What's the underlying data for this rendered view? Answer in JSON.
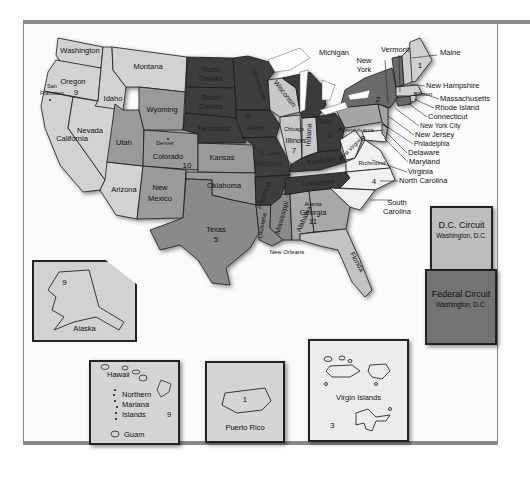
{
  "colors": {
    "light": "#d2d2d2",
    "mid": "#9a9a9a",
    "midDark": "#7e7e7e",
    "dark": "#3a3a3a",
    "white": "#f6f6f6",
    "lakes": "#ffffff",
    "border": "#1a1a1a"
  },
  "states": {
    "washington": "Washington",
    "oregon": "Oregon",
    "california": "California",
    "nevada": "Nevada",
    "idaho": "Idaho",
    "montana": "Montana",
    "arizona": "Arizona",
    "utah": "Utah",
    "wyoming": "Wyoming",
    "colorado": "Colorado",
    "new_mexico": "New\nMexico",
    "kansas": "Kansas",
    "oklahoma": "Oklahoma",
    "texas": "Texas",
    "north_dakota": "North\nDakota",
    "south_dakota": "South\nDakota",
    "nebraska": "Nebraska",
    "minnesota": "Minnesota",
    "iowa": "Iowa",
    "missouri": "Missouri",
    "arkansas": "Arkansas",
    "wisconsin": "Wisconsin",
    "illinois": "Illinois",
    "indiana": "Indiana",
    "michigan": "Michigan",
    "ohio": "Ohio",
    "kentucky": "Kentucky",
    "tennessee": "Tennessee",
    "louisiana": "Louisiana",
    "mississippi": "Mississippi",
    "alabama": "Alabama",
    "georgia": "Georgia",
    "florida": "Florida",
    "south_carolina": "South\nCarolina",
    "north_carolina": "North Carolina",
    "virginia": "Virginia",
    "west_virginia": "West\nVirginia",
    "maryland": "Maryland",
    "delaware": "Delaware",
    "new_jersey": "New Jersey",
    "pennsylvania": "Pennsylvania",
    "new_york": "New\nYork",
    "vermont": "Vermont",
    "maine": "Maine",
    "new_hampshire": "New Hampshire",
    "massachusetts": "Massachusetts",
    "rhode_island": "Rhode Island",
    "connecticut": "Connecticut"
  },
  "cities": {
    "san_francisco": "San\nFrancisco",
    "denver": "Denver",
    "chicago": "Chicago",
    "st_louis": "St. Louis",
    "new_orleans": "New Orleans",
    "atlanta": "Atlanta",
    "richmond": "Richmond",
    "philadelphia": "Philadelphia",
    "new_york_city": "New York City",
    "boston": "Boston"
  },
  "circuit_numbers": {
    "first": "1",
    "second": "2",
    "third": "3",
    "fourth": "4",
    "fifth": "5",
    "sixth": "6",
    "seventh": "7",
    "eighth": "8",
    "ninth": "9",
    "tenth": "10",
    "eleventh": "11"
  },
  "insets": {
    "alaska": {
      "label": "Alaska",
      "circuit": "9"
    },
    "hawaii": {
      "label_hawaii": "Hawaii",
      "label_nmi_1": "Northern",
      "label_nmi_2": "Mariana",
      "label_nmi_3": "Islands",
      "label_guam": "Guam",
      "circuit": "9"
    },
    "puerto_rico": {
      "label": "Puerto Rico",
      "circuit": "1"
    },
    "virgin_islands": {
      "label": "Virgin Islands",
      "circuit": "3"
    }
  },
  "special_circuits": {
    "dc": {
      "title": "D.C. Circuit",
      "location": "Washington, D.C."
    },
    "federal": {
      "title": "Federal Circuit",
      "location": "Washington, D.C."
    }
  }
}
